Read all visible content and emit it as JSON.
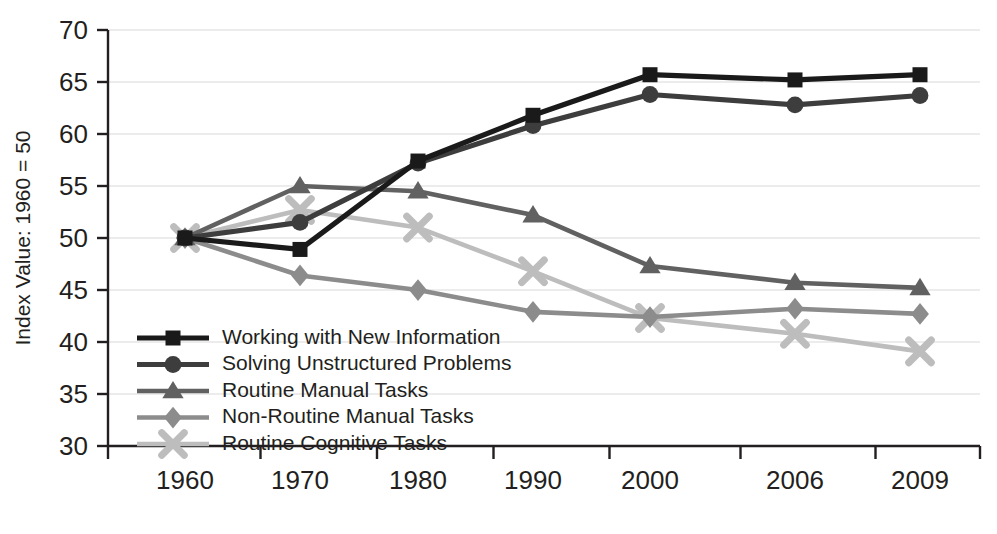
{
  "chart_data": {
    "type": "line",
    "title": "",
    "xlabel": "",
    "ylabel": "Index Value: 1960 = 50",
    "categories": [
      "1960",
      "1970",
      "1980",
      "1990",
      "2000",
      "2006",
      "2009"
    ],
    "ylim": [
      30,
      70
    ],
    "yticks": [
      "30",
      "35",
      "40",
      "45",
      "50",
      "55",
      "60",
      "65",
      "70"
    ],
    "grid": true,
    "legend_position": "inside-lower-left",
    "series": [
      {
        "name": "Working with New Information",
        "marker": "square",
        "color": "#1a1a1a",
        "values": [
          50.0,
          48.9,
          57.4,
          61.8,
          65.7,
          65.2,
          65.7
        ]
      },
      {
        "name": "Solving Unstructured Problems",
        "marker": "circle",
        "color": "#3d3d3d",
        "values": [
          50.0,
          51.5,
          57.2,
          60.8,
          63.8,
          62.8,
          63.7
        ]
      },
      {
        "name": "Routine Manual Tasks",
        "marker": "triangle",
        "color": "#616161",
        "values": [
          50.0,
          55.0,
          54.5,
          52.2,
          47.3,
          45.7,
          45.2
        ]
      },
      {
        "name": "Non-Routine Manual Tasks",
        "marker": "diamond",
        "color": "#8c8c8c",
        "values": [
          50.0,
          46.4,
          45.0,
          42.9,
          42.4,
          43.2,
          42.7
        ]
      },
      {
        "name": "Routine Cognitive Tasks",
        "marker": "cross",
        "color": "#bdbdbd",
        "values": [
          50.0,
          52.7,
          51.0,
          46.8,
          42.3,
          40.8,
          39.1
        ]
      }
    ]
  }
}
